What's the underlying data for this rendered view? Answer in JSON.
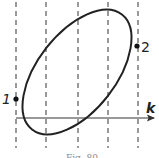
{
  "figure": {
    "axis_label": "k",
    "points": [
      {
        "id": "1",
        "label": "1"
      },
      {
        "id": "2",
        "label": "2"
      }
    ],
    "dashed_lines_count": 5,
    "caption": "Fig. 80"
  },
  "colors": {
    "ink": "#222222",
    "dash": "#333333",
    "background": "#ffffff"
  }
}
